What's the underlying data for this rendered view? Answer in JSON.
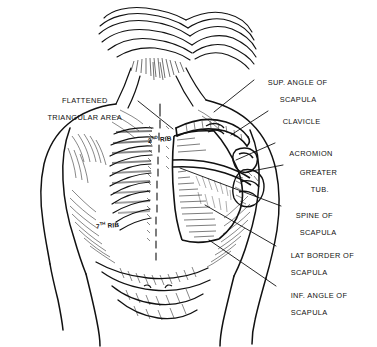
{
  "plate": {
    "title": "Surface anatomy of the back — scapula landmarks",
    "medium": "pen-and-ink line drawing",
    "background_color": "#ffffff",
    "ink_color": "#111111",
    "width": 377,
    "height": 347
  },
  "labels_right": [
    {
      "name": "sup-angle-of-scapula",
      "line1": "SUP. ANGLE OF",
      "line2": "SCAPULA",
      "x": 258,
      "y": 70,
      "lead_x1": 254,
      "lead_y1": 80,
      "lead_x2": 214,
      "lead_y2": 112
    },
    {
      "name": "clavicle",
      "line1": "CLAVICLE",
      "line2": "",
      "x": 273,
      "y": 109,
      "lead_x1": 268,
      "lead_y1": 111,
      "lead_x2": 231,
      "lead_y2": 135
    },
    {
      "name": "acromion",
      "line1": "ACROMION",
      "line2": "",
      "x": 280,
      "y": 141,
      "lead_x1": 275,
      "lead_y1": 143,
      "lead_x2": 236,
      "lead_y2": 160
    },
    {
      "name": "greater-tub",
      "line1": "GREATER",
      "line2": "TUB.",
      "x": 290,
      "y": 160,
      "lead_x1": 283,
      "lead_y1": 165,
      "lead_x2": 247,
      "lead_y2": 172
    },
    {
      "name": "spine-of-scapula",
      "line1": "SPINE OF",
      "line2": "SCAPULA",
      "x": 286,
      "y": 203,
      "lead_x1": 281,
      "lead_y1": 206,
      "lead_x2": 180,
      "lead_y2": 168
    },
    {
      "name": "lat-border-of-scapula",
      "line1": "LAT BORDER OF",
      "line2": "SCAPULA",
      "x": 281,
      "y": 243,
      "lead_x1": 276,
      "lead_y1": 246,
      "lead_x2": 205,
      "lead_y2": 205
    },
    {
      "name": "inf-angle-of-scapula",
      "line1": "INF. ANGLE OF",
      "line2": "SCAPULA",
      "x": 281,
      "y": 283,
      "lead_x1": 276,
      "lead_y1": 286,
      "lead_x2": 209,
      "lead_y2": 240
    }
  ],
  "labels_left": [
    {
      "name": "flattened-triangular-area",
      "line1": "FLATTENED",
      "line2": "TRIANGULAR AREA",
      "x": 20,
      "y": 88,
      "lead_x1": 138,
      "lead_y1": 101,
      "lead_x2": 173,
      "lead_y2": 129
    }
  ],
  "figure_labels": [
    {
      "name": "second-rib",
      "number": "2",
      "ordinal": "ND",
      "text": " RIB",
      "x": 140,
      "y": 132
    },
    {
      "name": "seventh-rib",
      "number": "7",
      "ordinal": "TH",
      "text": " RIB",
      "x": 88,
      "y": 218
    }
  ]
}
